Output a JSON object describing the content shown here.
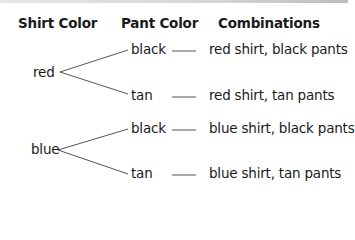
{
  "headers": {
    "shirt": "Shirt Color",
    "pant": "Pant Color",
    "combinations": "Combinations"
  },
  "tree": [
    {
      "shirt": "red",
      "branches": [
        {
          "pant": "black",
          "combination": "red shirt, black pants"
        },
        {
          "pant": "tan",
          "combination": "red shirt, tan pants"
        }
      ]
    },
    {
      "shirt": "blue",
      "branches": [
        {
          "pant": "black",
          "combination": "blue shirt, black pants"
        },
        {
          "pant": "tan",
          "combination": "blue shirt, tan pants"
        }
      ]
    }
  ],
  "colors": {
    "text": "#1a1a1a",
    "line": "#555555"
  }
}
